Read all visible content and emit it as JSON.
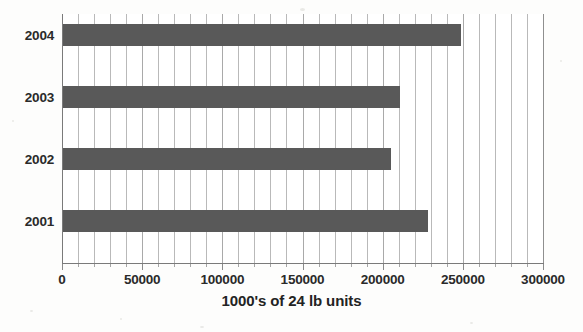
{
  "chart_data": {
    "type": "bar",
    "orientation": "horizontal",
    "title": "",
    "xlabel": "1000's of 24 lb units",
    "ylabel": "",
    "categories": [
      "2004",
      "2003",
      "2002",
      "2001"
    ],
    "values": [
      249000,
      211000,
      205000,
      228000
    ],
    "series": [
      {
        "name": "1000's of 24 lb units",
        "values": [
          249000,
          211000,
          205000,
          228000
        ],
        "color": "#595959"
      }
    ],
    "xlim": [
      0,
      300000
    ],
    "xticks": [
      0,
      50000,
      100000,
      150000,
      200000,
      250000,
      300000
    ],
    "xtick_labels": [
      "0",
      "50000",
      "100000",
      "150000",
      "200000",
      "250000",
      "300000"
    ],
    "minor_tick_interval": 10000,
    "grid": {
      "vertical": true,
      "horizontal": false,
      "minor_vertical": true
    },
    "legend": {
      "visible": false,
      "position": "none"
    },
    "colors": {
      "bar": "#595959",
      "gridline": "#b9b9b9",
      "major_gridline": "#a9a9a9",
      "axis": "#7a7a7a",
      "text": "#2a2a2a",
      "background": "#fdfdfc",
      "plot_background": "#ffffff"
    }
  }
}
